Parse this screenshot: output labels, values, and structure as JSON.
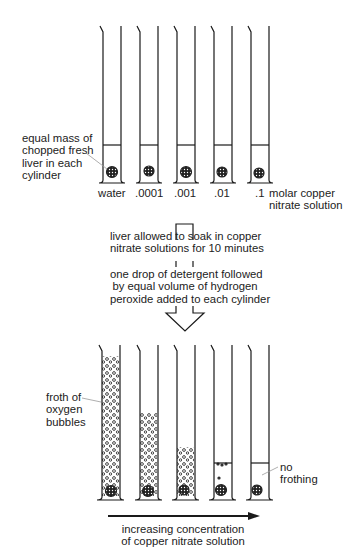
{
  "top_setup": {
    "label_liver": [
      "equal mass of",
      "chopped fresh",
      "liver in each",
      "cylinder"
    ],
    "concentrations": [
      "water",
      ".0001",
      ".001",
      ".01",
      ".1"
    ],
    "unit_label": [
      "molar copper",
      "nitrate solution"
    ]
  },
  "steps": {
    "step1": [
      "liver allowed to soak in copper",
      "nitrate solutions for 10 minutes"
    ],
    "step2": [
      "one drop of detergent followed",
      "by equal volume of hydrogen",
      "peroxide added to each cylinder"
    ]
  },
  "bottom_result": {
    "label_froth": [
      "froth of",
      "oxygen",
      "bubbles"
    ],
    "label_no_froth": [
      "no",
      "frothing"
    ],
    "arrow_label": [
      "increasing concentration",
      "of copper nitrate solution"
    ],
    "froth_top_y": [
      356,
      413,
      447,
      463,
      463
    ]
  },
  "colors": {
    "line": "#1a1a1a",
    "leader": "#888888"
  }
}
